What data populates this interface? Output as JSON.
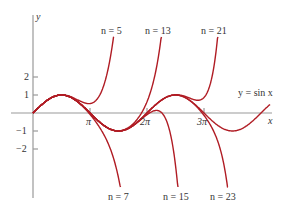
{
  "chart_data": {
    "type": "line",
    "title": "",
    "xlabel": "x",
    "ylabel": "y",
    "x_ticks": [
      "π",
      "2π",
      "3π"
    ],
    "y_ticks": [
      "2",
      "1",
      "−1",
      "−2"
    ],
    "xlim": [
      -0.65,
      13.3
    ],
    "ylim": [
      -4.7,
      5.4
    ],
    "grid": false,
    "series": [
      {
        "name": "y = sin x",
        "function": "sin",
        "label": "y = sin x"
      },
      {
        "name": "n = 5",
        "taylor_degree": 5,
        "label": "n = 5"
      },
      {
        "name": "n = 7",
        "taylor_degree": 7,
        "label": "n = 7"
      },
      {
        "name": "n = 13",
        "taylor_degree": 13,
        "label": "n = 13"
      },
      {
        "name": "n = 15",
        "taylor_degree": 15,
        "label": "n = 15"
      },
      {
        "name": "n = 21",
        "taylor_degree": 21,
        "label": "n = 21"
      },
      {
        "name": "n = 23",
        "taylor_degree": 23,
        "label": "n = 23"
      }
    ],
    "curve_color": "#b01c24",
    "axis_color": "#999999"
  },
  "labels": {
    "y_axis": "y",
    "x_axis": "x",
    "sin": "y = sin x",
    "n5": "n = 5",
    "n7": "n = 7",
    "n13": "n = 13",
    "n15": "n = 15",
    "n21": "n = 21",
    "n23": "n = 23",
    "tick_pi": "π",
    "tick_2pi": "2π",
    "tick_3pi": "3π",
    "tick_2": "2",
    "tick_1": "1",
    "tick_m1": "−1",
    "tick_m2": "−2"
  }
}
